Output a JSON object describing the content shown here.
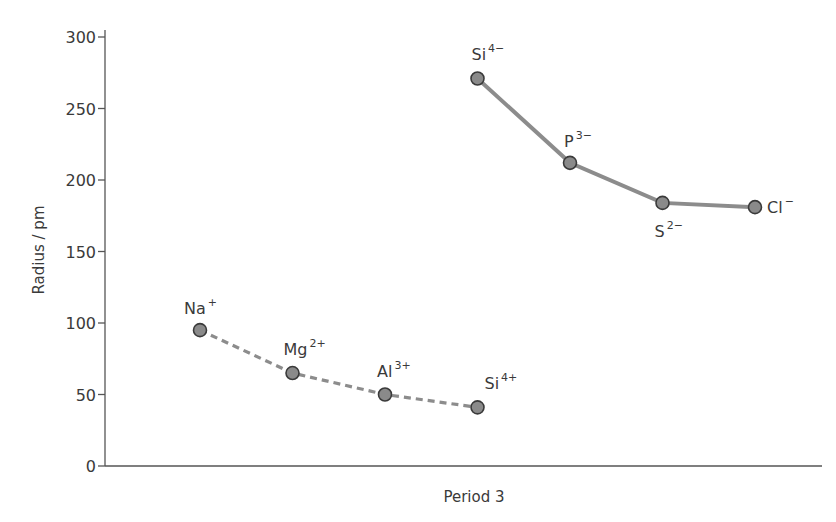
{
  "chart_data": {
    "type": "line",
    "title": "",
    "xlabel": "Period 3",
    "ylabel": "Radius / pm",
    "ylim": [
      0,
      300
    ],
    "yticks": [
      0,
      50,
      100,
      150,
      200,
      250,
      300
    ],
    "grid": false,
    "legend": null,
    "series": [
      {
        "name": "Cations",
        "style": "dashed",
        "points": [
          {
            "x": 1,
            "label": "Na",
            "charge": "+",
            "value": 95
          },
          {
            "x": 2,
            "label": "Mg",
            "charge": "2+",
            "value": 65
          },
          {
            "x": 3,
            "label": "Al",
            "charge": "3+",
            "value": 50
          },
          {
            "x": 4,
            "label": "Si",
            "charge": "4+",
            "value": 41
          }
        ]
      },
      {
        "name": "Anions",
        "style": "solid",
        "points": [
          {
            "x": 4,
            "label": "Si",
            "charge": "4−",
            "value": 271
          },
          {
            "x": 5,
            "label": "P",
            "charge": "3−",
            "value": 212
          },
          {
            "x": 6,
            "label": "S",
            "charge": "2−",
            "value": 184
          },
          {
            "x": 7,
            "label": "Cl",
            "charge": "−",
            "value": 181
          }
        ]
      }
    ]
  },
  "colors": {
    "axis": "#555555",
    "line": "#8c8c8c",
    "marker_fill": "#8a8a8a",
    "marker_stroke": "#3a3a3a",
    "text": "#3a3a3a"
  }
}
